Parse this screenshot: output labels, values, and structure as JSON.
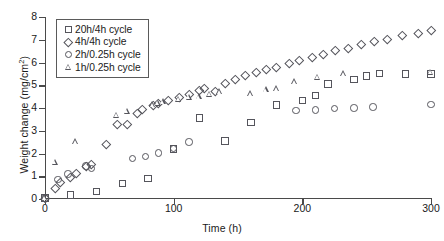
{
  "chart_data": {
    "type": "scatter",
    "title": "",
    "xlabel": "Time (h)",
    "ylabel": "Weight change (mg/cm2)",
    "ylabel_html": "Weight change (mg/cm<sup>2</sup>)",
    "xlim": [
      0,
      300
    ],
    "ylim": [
      0,
      8
    ],
    "xticks": [
      0,
      100,
      200,
      300
    ],
    "yticks": [
      0,
      1,
      2,
      3,
      4,
      5,
      6,
      7,
      8
    ],
    "grid": false,
    "legend_position": "top-left",
    "marker_color": "#55555c",
    "axis_color": "#4a4a4a",
    "series": [
      {
        "name": "20h/4h cycle",
        "marker": "square",
        "points": [
          [
            0,
            0.05
          ],
          [
            20,
            0.18
          ],
          [
            40,
            0.33
          ],
          [
            60,
            0.69
          ],
          [
            80,
            0.91
          ],
          [
            100,
            2.19
          ],
          [
            120,
            3.56
          ],
          [
            140,
            2.55
          ],
          [
            160,
            3.37
          ],
          [
            180,
            4.13
          ],
          [
            200,
            4.33
          ],
          [
            210,
            4.55
          ],
          [
            220,
            5.05
          ],
          [
            240,
            5.25
          ],
          [
            250,
            5.4
          ],
          [
            260,
            5.52
          ],
          [
            280,
            5.5
          ],
          [
            300,
            5.5
          ]
        ]
      },
      {
        "name": "4h/4h cycle",
        "marker": "diamond",
        "points": [
          [
            0,
            0.05
          ],
          [
            8,
            0.45
          ],
          [
            12,
            0.72
          ],
          [
            20,
            0.95
          ],
          [
            24,
            1.12
          ],
          [
            32,
            1.45
          ],
          [
            36,
            1.52
          ],
          [
            48,
            2.42
          ],
          [
            56,
            3.28
          ],
          [
            64,
            3.3
          ],
          [
            72,
            3.77
          ],
          [
            76,
            3.95
          ],
          [
            84,
            4.12
          ],
          [
            88,
            4.2
          ],
          [
            96,
            4.35
          ],
          [
            104,
            4.45
          ],
          [
            112,
            4.6
          ],
          [
            120,
            4.78
          ],
          [
            124,
            4.88
          ],
          [
            132,
            4.73
          ],
          [
            140,
            5.1
          ],
          [
            148,
            5.28
          ],
          [
            156,
            5.45
          ],
          [
            164,
            5.58
          ],
          [
            172,
            5.72
          ],
          [
            180,
            5.8
          ],
          [
            190,
            5.95
          ],
          [
            198,
            6.1
          ],
          [
            208,
            6.22
          ],
          [
            216,
            6.35
          ],
          [
            226,
            6.52
          ],
          [
            236,
            6.62
          ],
          [
            246,
            6.78
          ],
          [
            256,
            6.92
          ],
          [
            266,
            7.02
          ],
          [
            278,
            7.18
          ],
          [
            290,
            7.3
          ],
          [
            300,
            7.42
          ]
        ]
      },
      {
        "name": "2h/0.25h cycle",
        "marker": "circle",
        "points": [
          [
            0,
            0.05
          ],
          [
            10,
            0.85
          ],
          [
            18,
            1.1
          ],
          [
            32,
            1.45
          ],
          [
            36,
            1.35
          ],
          [
            68,
            1.78
          ],
          [
            78,
            1.88
          ],
          [
            88,
            2.02
          ],
          [
            100,
            2.22
          ],
          [
            112,
            2.5
          ],
          [
            195,
            3.9
          ],
          [
            210,
            3.92
          ],
          [
            225,
            3.97
          ],
          [
            240,
            4.0
          ],
          [
            255,
            4.05
          ],
          [
            300,
            4.15
          ]
        ]
      },
      {
        "name": "1h/0.25h cycle",
        "marker": "triangle",
        "points": [
          [
            0,
            0.05
          ],
          [
            8,
            1.62
          ],
          [
            24,
            2.52
          ],
          [
            56,
            3.68
          ],
          [
            64,
            3.85
          ],
          [
            84,
            4.15
          ],
          [
            88,
            4.2
          ],
          [
            92,
            4.28
          ],
          [
            104,
            4.38
          ],
          [
            112,
            4.48
          ],
          [
            120,
            4.5
          ],
          [
            128,
            4.6
          ],
          [
            136,
            4.72
          ],
          [
            160,
            4.62
          ],
          [
            172,
            4.8
          ],
          [
            180,
            4.85
          ],
          [
            194,
            5.15
          ],
          [
            212,
            5.35
          ],
          [
            232,
            5.5
          ],
          [
            300,
            5.58
          ]
        ]
      }
    ]
  },
  "legend": {
    "items": [
      {
        "label": "20h/4h cycle",
        "marker": "square"
      },
      {
        "label": "4h/4h cycle",
        "marker": "diamond"
      },
      {
        "label": "2h/0.25h cycle",
        "marker": "circle"
      },
      {
        "label": "1h/0.25h cycle",
        "marker": "triangle"
      }
    ]
  }
}
